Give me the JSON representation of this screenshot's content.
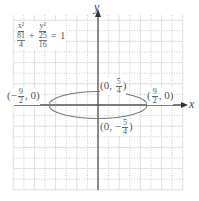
{
  "chart_data": {
    "type": "line",
    "title": "",
    "equation": {
      "display": "x^2/(81/4) + y^2/(25/16) = 1",
      "term1": {
        "numerator": "x²",
        "denominator_numerator": "81",
        "denominator_denominator": "4"
      },
      "term2": {
        "numerator": "y²",
        "denominator_numerator": "25",
        "denominator_denominator": "16"
      },
      "plus": "+",
      "equals": "=",
      "rhs": "1"
    },
    "xlabel": "x",
    "ylabel": "y",
    "xlim": [
      -8,
      8
    ],
    "ylim": [
      -8,
      8
    ],
    "grid": true,
    "curve": {
      "shape": "ellipse",
      "center": [
        0,
        0
      ],
      "a": 4.5,
      "b": 1.25
    },
    "points": [
      {
        "label": "(0, 5/4)",
        "x": 0,
        "y": 1.25,
        "num": "5",
        "den": "4",
        "sign": ""
      },
      {
        "label": "(0, -5/4)",
        "x": 0,
        "y": -1.25,
        "num": "5",
        "den": "4",
        "sign": "−"
      },
      {
        "label": "(-9/2, 0)",
        "x": -4.5,
        "y": 0,
        "num": "9",
        "den": "2",
        "sign": "−"
      },
      {
        "label": "(9/2, 0)",
        "x": 4.5,
        "y": 0,
        "num": "9",
        "den": "2",
        "sign": ""
      }
    ]
  },
  "labels": {
    "x_axis": "x",
    "y_axis": "y",
    "open": "(",
    "close": ")",
    "comma": ",",
    "zero": "0"
  },
  "colors": {
    "axis": "#555555",
    "grid_solid": "#d8d8d8",
    "grid_dotted": "#bdbdbd",
    "curve": "#777777"
  }
}
